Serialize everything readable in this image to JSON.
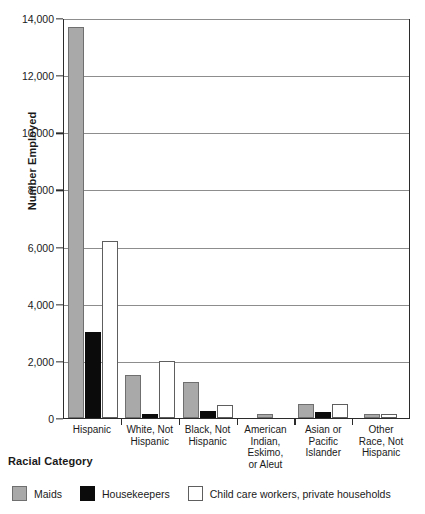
{
  "chart_data": {
    "type": "bar",
    "title": "",
    "xlabel": "Racial Category",
    "ylabel": "Number Employed",
    "ylim": [
      0,
      14000
    ],
    "yticks": [
      0,
      2000,
      4000,
      6000,
      8000,
      10000,
      12000,
      14000
    ],
    "ytick_labels": [
      "0",
      "2,000",
      "4,000",
      "6,000",
      "8,000",
      "10,000",
      "12,000",
      "14,000"
    ],
    "grid": true,
    "legend_position": "bottom",
    "categories": [
      "Hispanic",
      "White, Not Hispanic",
      "Black, Not Hispanic",
      "American Indian, Eskimo, or Aleut",
      "Asian or Pacific Islander",
      "Other Race, Not Hispanic"
    ],
    "category_label_lines": [
      [
        "Hispanic"
      ],
      [
        "White, Not",
        "Hispanic"
      ],
      [
        "Black, Not",
        "Hispanic"
      ],
      [
        "American",
        "Indian,",
        "Eskimo,",
        "or Aleut"
      ],
      [
        "Asian or",
        "Pacific",
        "Islander"
      ],
      [
        "Other",
        "Race, Not",
        "Hispanic"
      ]
    ],
    "series": [
      {
        "name": "Maids",
        "color": "#a9a9a9",
        "values": [
          13700,
          1500,
          1250,
          150,
          500,
          150
        ]
      },
      {
        "name": "Housekeepers",
        "color": "#0b0b0b",
        "values": [
          3000,
          150,
          250,
          0,
          200,
          0
        ]
      },
      {
        "name": "Child care workers, private households",
        "color": "#ffffff",
        "values": [
          6200,
          2000,
          450,
          0,
          480,
          150
        ]
      }
    ]
  },
  "legend": {
    "items": [
      {
        "label": "Maids",
        "key": "maids"
      },
      {
        "label": "Housekeepers",
        "key": "housekeepers"
      },
      {
        "label": "Child care workers, private households",
        "key": "childcare"
      }
    ]
  }
}
